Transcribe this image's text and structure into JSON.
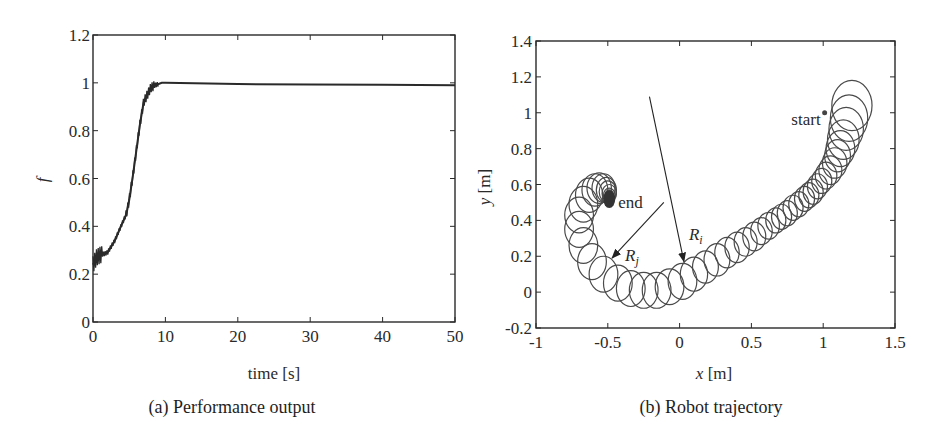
{
  "figure": {
    "panels": [
      {
        "caption": "(a) Performance output"
      },
      {
        "caption": "(b) Robot trajectory"
      }
    ]
  },
  "chart_data": [
    {
      "type": "line",
      "title": "(a) Performance output",
      "xlabel": "time [s]",
      "ylabel": "f",
      "xlim": [
        0,
        50
      ],
      "ylim": [
        0,
        1.2
      ],
      "xticks": [
        0,
        10,
        20,
        30,
        40,
        50
      ],
      "yticks": [
        0,
        0.2,
        0.4,
        0.6,
        0.8,
        1,
        1.2
      ],
      "ytick_labels": [
        "0",
        "0.2",
        "0.4",
        "0.6",
        "0.8",
        "1",
        "1.2"
      ],
      "grid": false,
      "series": [
        {
          "name": "f",
          "color": "#2a2a2a",
          "x": [
            0,
            0.5,
            1,
            2,
            3,
            4,
            4.6,
            5,
            5.5,
            6,
            6.5,
            7,
            7.5,
            8,
            8.6,
            9.5,
            10,
            20,
            30,
            40,
            50
          ],
          "y": [
            0.24,
            0.27,
            0.28,
            0.29,
            0.34,
            0.41,
            0.45,
            0.51,
            0.61,
            0.72,
            0.83,
            0.92,
            0.95,
            0.98,
            0.99,
            1.0,
            1.0,
            0.995,
            0.993,
            0.992,
            0.99
          ]
        }
      ]
    },
    {
      "type": "scatter",
      "title": "(b) Robot trajectory",
      "xlabel": "x [m]",
      "ylabel": "y [m]",
      "xlim": [
        -1,
        1.5
      ],
      "ylim": [
        -0.2,
        1.4
      ],
      "xticks": [
        -1,
        -0.5,
        0,
        0.5,
        1,
        1.5
      ],
      "xtick_labels": [
        "-1",
        "-0.5",
        "0",
        "0.5",
        "1",
        "1.5"
      ],
      "yticks": [
        -0.2,
        0,
        0.2,
        0.4,
        0.6,
        0.8,
        1,
        1.2,
        1.4
      ],
      "ytick_labels": [
        "-0.2",
        "0",
        "0.2",
        "0.4",
        "0.6",
        "0.8",
        "1",
        "1.2",
        "1.4"
      ],
      "grid": false,
      "annotations": [
        {
          "text": "start",
          "x": 1.01,
          "y": 1.0
        },
        {
          "text": "end",
          "x": -0.49,
          "y": 0.53
        },
        {
          "text": "R_i",
          "arrow_from": [
            -0.21,
            1.09
          ],
          "arrow_to": [
            0.03,
            0.17
          ]
        },
        {
          "text": "R_j",
          "arrow_from": [
            -0.11,
            0.5
          ],
          "arrow_to": [
            -0.47,
            0.19
          ]
        }
      ],
      "circles": [
        {
          "cx": 1.2,
          "cy": 1.04,
          "r": 0.14
        },
        {
          "cx": 1.18,
          "cy": 0.97,
          "r": 0.13
        },
        {
          "cx": 1.16,
          "cy": 0.91,
          "r": 0.12
        },
        {
          "cx": 1.14,
          "cy": 0.85,
          "r": 0.11
        },
        {
          "cx": 1.12,
          "cy": 0.8,
          "r": 0.1
        },
        {
          "cx": 1.1,
          "cy": 0.76,
          "r": 0.09
        },
        {
          "cx": 1.08,
          "cy": 0.72,
          "r": 0.085
        },
        {
          "cx": 1.05,
          "cy": 0.68,
          "r": 0.08
        },
        {
          "cx": 1.02,
          "cy": 0.65,
          "r": 0.075
        },
        {
          "cx": 0.99,
          "cy": 0.62,
          "r": 0.07
        },
        {
          "cx": 0.96,
          "cy": 0.59,
          "r": 0.07
        },
        {
          "cx": 0.93,
          "cy": 0.56,
          "r": 0.07
        },
        {
          "cx": 0.9,
          "cy": 0.54,
          "r": 0.07
        },
        {
          "cx": 0.87,
          "cy": 0.52,
          "r": 0.07
        },
        {
          "cx": 0.83,
          "cy": 0.49,
          "r": 0.07
        },
        {
          "cx": 0.79,
          "cy": 0.47,
          "r": 0.07
        },
        {
          "cx": 0.75,
          "cy": 0.44,
          "r": 0.07
        },
        {
          "cx": 0.71,
          "cy": 0.42,
          "r": 0.07
        },
        {
          "cx": 0.67,
          "cy": 0.4,
          "r": 0.07
        },
        {
          "cx": 0.62,
          "cy": 0.37,
          "r": 0.075
        },
        {
          "cx": 0.57,
          "cy": 0.34,
          "r": 0.075
        },
        {
          "cx": 0.52,
          "cy": 0.31,
          "r": 0.08
        },
        {
          "cx": 0.46,
          "cy": 0.28,
          "r": 0.08
        },
        {
          "cx": 0.4,
          "cy": 0.25,
          "r": 0.085
        },
        {
          "cx": 0.33,
          "cy": 0.22,
          "r": 0.085
        },
        {
          "cx": 0.26,
          "cy": 0.18,
          "r": 0.09
        },
        {
          "cx": 0.18,
          "cy": 0.14,
          "r": 0.09
        },
        {
          "cx": 0.1,
          "cy": 0.1,
          "r": 0.095
        },
        {
          "cx": 0.02,
          "cy": 0.06,
          "r": 0.1
        },
        {
          "cx": -0.07,
          "cy": 0.03,
          "r": 0.1
        },
        {
          "cx": -0.16,
          "cy": 0.01,
          "r": 0.1
        },
        {
          "cx": -0.25,
          "cy": 0.01,
          "r": 0.1
        },
        {
          "cx": -0.34,
          "cy": 0.02,
          "r": 0.1
        },
        {
          "cx": -0.43,
          "cy": 0.05,
          "r": 0.1
        },
        {
          "cx": -0.53,
          "cy": 0.1,
          "r": 0.1
        },
        {
          "cx": -0.61,
          "cy": 0.17,
          "r": 0.1
        },
        {
          "cx": -0.67,
          "cy": 0.26,
          "r": 0.1
        },
        {
          "cx": -0.7,
          "cy": 0.35,
          "r": 0.1
        },
        {
          "cx": -0.7,
          "cy": 0.43,
          "r": 0.1
        },
        {
          "cx": -0.67,
          "cy": 0.49,
          "r": 0.1
        },
        {
          "cx": -0.63,
          "cy": 0.54,
          "r": 0.095
        },
        {
          "cx": -0.59,
          "cy": 0.57,
          "r": 0.09
        },
        {
          "cx": -0.56,
          "cy": 0.58,
          "r": 0.085
        },
        {
          "cx": -0.53,
          "cy": 0.58,
          "r": 0.08
        },
        {
          "cx": -0.51,
          "cy": 0.57,
          "r": 0.07
        },
        {
          "cx": -0.5,
          "cy": 0.56,
          "r": 0.06
        },
        {
          "cx": -0.49,
          "cy": 0.55,
          "r": 0.05
        },
        {
          "cx": -0.49,
          "cy": 0.54,
          "r": 0.04
        },
        {
          "cx": -0.49,
          "cy": 0.54,
          "r": 0.03
        }
      ],
      "circle_color": "#4a4a4a",
      "line_color": "#2a2a2a"
    }
  ]
}
